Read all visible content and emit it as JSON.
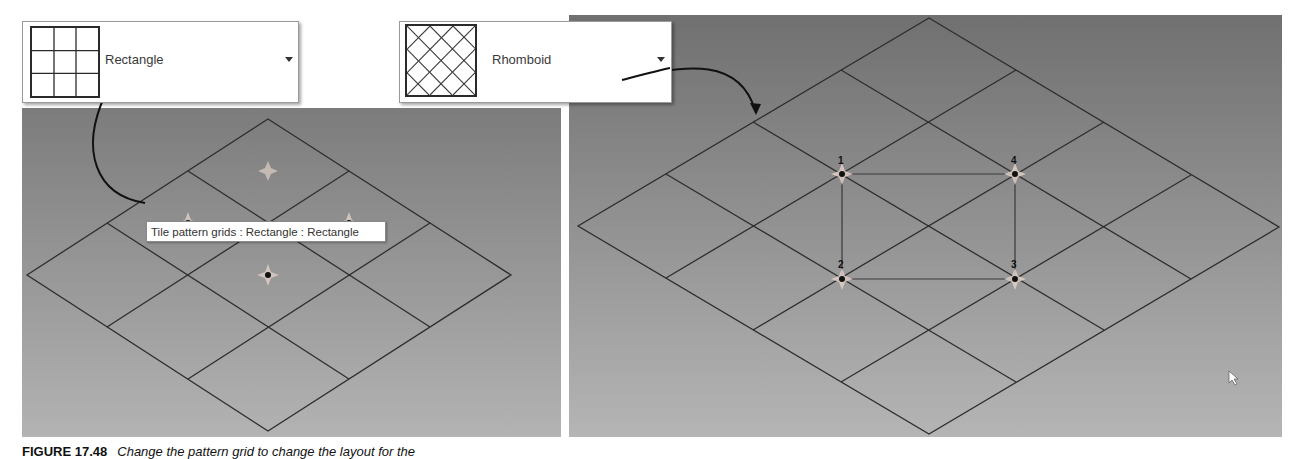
{
  "dropdowns": [
    {
      "id": "rectangle",
      "label": "Rectangle",
      "icon": "rectangle-grid-pattern-icon",
      "arrow": "dropdown-arrow-icon"
    },
    {
      "id": "rhomboid",
      "label": "Rhomboid",
      "icon": "rhomboid-grid-pattern-icon",
      "arrow": "dropdown-arrow-icon"
    }
  ],
  "left_viewport": {
    "tooltip": "Tile pattern grids : Rectangle : Rectangle",
    "grid_divisions": 3,
    "grid_vertices": {
      "top": [
        268,
        119
      ],
      "right": [
        511,
        275
      ],
      "bottom": [
        268,
        431
      ],
      "left": [
        27,
        275
      ]
    }
  },
  "right_viewport": {
    "grid_divisions": 4,
    "grid_vertices": {
      "top": [
        929,
        18
      ],
      "right": [
        1279,
        227
      ],
      "bottom": [
        929,
        434
      ],
      "left": [
        578,
        226
      ]
    },
    "points": [
      {
        "label": "1",
        "x": 842,
        "y": 174
      },
      {
        "label": "2",
        "x": 842,
        "y": 279
      },
      {
        "label": "3",
        "x": 1015,
        "y": 279
      },
      {
        "label": "4",
        "x": 1015,
        "y": 174
      }
    ]
  },
  "caption": {
    "figure": "FIGURE 17.48",
    "text": "Change the pattern grid to change the layout for the"
  },
  "colors": {
    "grid_line": "#2e2e2e",
    "viewport_bg_top": "#7c7c7c",
    "viewport_bg_bottom": "#b3b3b3",
    "annotation_arrow": "#111111"
  }
}
